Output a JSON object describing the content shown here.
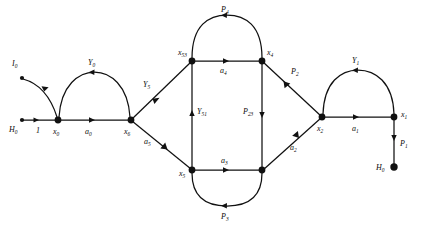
{
  "figure": {
    "type": "directed-graph-diagram",
    "background_color": "#ffffff",
    "ink_color": "#111111"
  },
  "nodes": [
    {
      "id": "H0_left",
      "label": "H",
      "sub": "0",
      "x": 22,
      "y": 120,
      "size": "small",
      "label_side": "left"
    },
    {
      "id": "x0",
      "label": "x",
      "sub": "0",
      "x": 58,
      "y": 120,
      "size": "large",
      "label_side": "below"
    },
    {
      "id": "I0",
      "label": "I",
      "sub": "0",
      "x": 22,
      "y": 78,
      "size": "small",
      "label_side": "above"
    },
    {
      "id": "x6",
      "label": "x",
      "sub": "6",
      "x": 131,
      "y": 120,
      "size": "large",
      "label_side": "below"
    },
    {
      "id": "x53",
      "label": "x",
      "sub": "53",
      "x": 192,
      "y": 61,
      "size": "large",
      "label_side": "above-left"
    },
    {
      "id": "x4",
      "label": "x",
      "sub": "4",
      "x": 262,
      "y": 61,
      "size": "large",
      "label_side": "above-right"
    },
    {
      "id": "x5",
      "label": "x",
      "sub": "5",
      "x": 192,
      "y": 170,
      "size": "large",
      "label_side": "left"
    },
    {
      "id": "x3_node",
      "label": "",
      "sub": "",
      "x": 262,
      "y": 170,
      "size": "large",
      "label_side": "none"
    },
    {
      "id": "x2",
      "label": "x",
      "sub": "2",
      "x": 322,
      "y": 117,
      "size": "large",
      "label_side": "below"
    },
    {
      "id": "x1",
      "label": "x",
      "sub": "1",
      "x": 394,
      "y": 117,
      "size": "large",
      "label_side": "right"
    },
    {
      "id": "H0_right",
      "label": "H",
      "sub": "0",
      "x": 394,
      "y": 167,
      "size": "large",
      "label_side": "left"
    }
  ],
  "edges": [
    {
      "id": "e_one",
      "label": "1",
      "sub": "",
      "from": "H0_left",
      "to": "x0",
      "shape": "straight",
      "arrow": "forward"
    },
    {
      "id": "e_I0",
      "label": "",
      "sub": "",
      "from": "x0",
      "to": "I0",
      "shape": "arc",
      "arrow": "forward"
    },
    {
      "id": "e_a0",
      "label": "a",
      "sub": "0",
      "from": "x0",
      "to": "x6",
      "shape": "straight",
      "arrow": "forward"
    },
    {
      "id": "e_Y0",
      "label": "Y",
      "sub": "0",
      "from": "x6",
      "to": "x0",
      "shape": "arc-top",
      "arrow": "forward"
    },
    {
      "id": "e_Y5",
      "label": "Y",
      "sub": "5",
      "from": "x53",
      "to": "x6",
      "shape": "straight",
      "arrow": "forward"
    },
    {
      "id": "e_a5",
      "label": "a",
      "sub": "5",
      "from": "x6",
      "to": "x5",
      "shape": "straight",
      "arrow": "forward"
    },
    {
      "id": "e_a4",
      "label": "a",
      "sub": "4",
      "from": "x53",
      "to": "x4",
      "shape": "straight",
      "arrow": "forward"
    },
    {
      "id": "e_P4",
      "label": "P",
      "sub": "4",
      "from": "x4",
      "to": "x53",
      "shape": "arc-top",
      "arrow": "forward"
    },
    {
      "id": "e_Y51",
      "label": "Y",
      "sub": "51",
      "from": "x5",
      "to": "x53",
      "shape": "straight",
      "arrow": "forward"
    },
    {
      "id": "e_P23",
      "label": "P",
      "sub": "23",
      "from": "x4",
      "to": "x3_node",
      "shape": "straight",
      "arrow": "forward"
    },
    {
      "id": "e_a3",
      "label": "a",
      "sub": "3",
      "from": "x5",
      "to": "x3_node",
      "shape": "straight",
      "arrow": "forward"
    },
    {
      "id": "e_P3",
      "label": "P",
      "sub": "3",
      "from": "x3_node",
      "to": "x5",
      "shape": "arc-bottom",
      "arrow": "forward"
    },
    {
      "id": "e_P2",
      "label": "P",
      "sub": "2",
      "from": "x2",
      "to": "x4",
      "shape": "straight",
      "arrow": "forward"
    },
    {
      "id": "e_a2",
      "label": "a",
      "sub": "2",
      "from": "x3_node",
      "to": "x2",
      "shape": "straight",
      "arrow": "forward"
    },
    {
      "id": "e_a1",
      "label": "a",
      "sub": "1",
      "from": "x2",
      "to": "x1",
      "shape": "straight",
      "arrow": "forward"
    },
    {
      "id": "e_Y1",
      "label": "Y",
      "sub": "1",
      "from": "x1",
      "to": "x2",
      "shape": "arc-top",
      "arrow": "forward"
    },
    {
      "id": "e_P1",
      "label": "P",
      "sub": "1",
      "from": "x1",
      "to": "H0_right",
      "shape": "straight",
      "arrow": "forward"
    }
  ],
  "labels": {
    "I0": {
      "text": "I",
      "sub": "0"
    },
    "H0L": {
      "text": "H",
      "sub": "0"
    },
    "one": {
      "text": "1",
      "sub": ""
    },
    "x0": {
      "text": "x",
      "sub": "0"
    },
    "a0": {
      "text": "a",
      "sub": "0"
    },
    "Y0": {
      "text": "Y",
      "sub": "0"
    },
    "x6": {
      "text": "x",
      "sub": "6"
    },
    "Y5": {
      "text": "Y",
      "sub": "5"
    },
    "a5": {
      "text": "a",
      "sub": "5"
    },
    "x53": {
      "text": "x",
      "sub": "53"
    },
    "P4": {
      "text": "P",
      "sub": "4"
    },
    "a4": {
      "text": "a",
      "sub": "4"
    },
    "x4": {
      "text": "x",
      "sub": "4"
    },
    "Y51": {
      "text": "Y",
      "sub": "51"
    },
    "P23": {
      "text": "P",
      "sub": "23"
    },
    "x5": {
      "text": "x",
      "sub": "5"
    },
    "a3": {
      "text": "a",
      "sub": "3"
    },
    "P3": {
      "text": "P",
      "sub": "3"
    },
    "P2": {
      "text": "P",
      "sub": "2"
    },
    "a2": {
      "text": "a",
      "sub": "2"
    },
    "x2": {
      "text": "x",
      "sub": "2"
    },
    "Y1": {
      "text": "Y",
      "sub": "1"
    },
    "a1": {
      "text": "a",
      "sub": "1"
    },
    "x1": {
      "text": "x",
      "sub": "1"
    },
    "P1": {
      "text": "P",
      "sub": "1"
    },
    "H0R": {
      "text": "H",
      "sub": "0"
    }
  }
}
